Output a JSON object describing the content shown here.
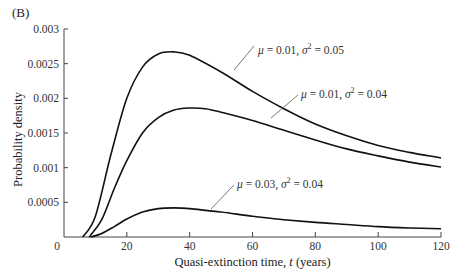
{
  "panel_label": "(B)",
  "chart_data": {
    "type": "line",
    "title": "",
    "xlabel": "Quasi-extinction time, t (years)",
    "ylabel": "Probability density",
    "xlim": [
      0,
      120
    ],
    "ylim": [
      0,
      0.003
    ],
    "x_ticks": [
      0,
      20,
      40,
      60,
      80,
      100,
      120
    ],
    "y_ticks": [
      0,
      0.0005,
      0.001,
      0.0015,
      0.002,
      0.0025,
      0.003
    ],
    "y_tick_labels": [
      "0",
      "0.0005",
      "0.001",
      "0.0015",
      "0.002",
      "0.0025",
      "0.003"
    ],
    "grid": false,
    "legend": "inline annotations with leader lines",
    "series": [
      {
        "name": "μ = 0.01, σ² = 0.05",
        "mu": "0.01",
        "sigma2": "0.05",
        "x": [
          6,
          10,
          15,
          20,
          25,
          30,
          35,
          40,
          50,
          60,
          70,
          80,
          90,
          100,
          110,
          120
        ],
        "values": [
          0,
          0.0003,
          0.0012,
          0.002,
          0.00245,
          0.00264,
          0.00267,
          0.00262,
          0.00238,
          0.0021,
          0.00185,
          0.00163,
          0.00146,
          0.00132,
          0.00122,
          0.00114
        ]
      },
      {
        "name": "μ = 0.01, σ² = 0.04",
        "mu": "0.01",
        "sigma2": "0.04",
        "x": [
          8,
          12,
          16,
          20,
          25,
          30,
          35,
          40,
          45,
          50,
          60,
          70,
          80,
          90,
          100,
          110,
          120
        ],
        "values": [
          0,
          0.00025,
          0.0007,
          0.0011,
          0.0015,
          0.00172,
          0.00183,
          0.00186,
          0.00185,
          0.0018,
          0.00168,
          0.00154,
          0.0014,
          0.00127,
          0.00117,
          0.00108,
          0.00101
        ]
      },
      {
        "name": "μ = 0.03, σ² = 0.04",
        "mu": "0.03",
        "sigma2": "0.04",
        "x": [
          8.5,
          12,
          16,
          20,
          25,
          30,
          35,
          40,
          50,
          60,
          70,
          80,
          90,
          100,
          110,
          120
        ],
        "values": [
          0,
          5e-05,
          0.00015,
          0.00026,
          0.00036,
          0.00041,
          0.00042,
          0.00041,
          0.00036,
          0.0003,
          0.00025,
          0.00021,
          0.00018,
          0.00015,
          0.00013,
          0.00012
        ]
      }
    ],
    "annotations": [
      {
        "text": "μ = 0.01,  σ² = 0.05",
        "series": 0
      },
      {
        "text": "μ = 0.01,  σ² = 0.04",
        "series": 1
      },
      {
        "text": "μ = 0.03,  σ² = 0.04",
        "series": 2
      }
    ]
  }
}
